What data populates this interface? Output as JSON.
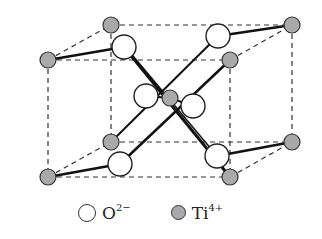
{
  "diagram": {
    "type": "crystal-structure",
    "colors": {
      "oxygen_fill": "#ffffff",
      "titanium_fill": "#a9a9a9",
      "stroke": "#333333"
    }
  },
  "legend": {
    "items": [
      {
        "symbol": "O",
        "charge": "2−",
        "kind": "oxygen"
      },
      {
        "symbol": "Ti",
        "charge": "4+",
        "kind": "titanium"
      }
    ]
  }
}
